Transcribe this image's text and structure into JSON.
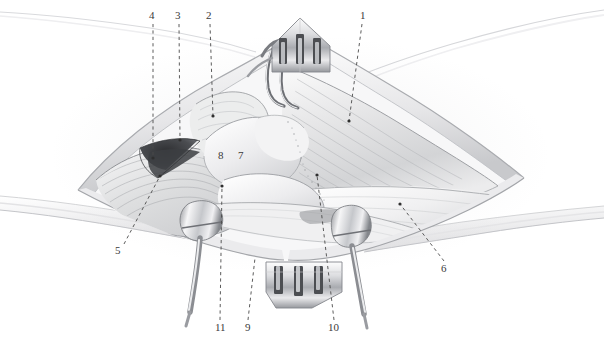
{
  "figure": {
    "medium": "grayscale pencil / airbrush medical illustration",
    "background_color": "#ffffff",
    "ink_color": "#3a3a3a",
    "width": 604,
    "height": 340
  },
  "labels": [
    {
      "id": "label-1",
      "text": "1",
      "x": 360,
      "y": 10,
      "leader": {
        "from": [
          362,
          24
        ],
        "to": [
          349,
          121
        ],
        "dot_at_end": true
      }
    },
    {
      "id": "label-2",
      "text": "2",
      "x": 206,
      "y": 10,
      "leader": {
        "from": [
          210,
          24
        ],
        "to": [
          213,
          116
        ],
        "dot_at_end": true
      }
    },
    {
      "id": "label-3",
      "text": "3",
      "x": 175,
      "y": 10,
      "leader": {
        "from": [
          179,
          24
        ],
        "to": [
          180,
          140
        ],
        "dot_at_end": true
      }
    },
    {
      "id": "label-4",
      "text": "4",
      "x": 149,
      "y": 10,
      "leader": {
        "from": [
          153,
          24
        ],
        "to": [
          153,
          158
        ],
        "dot_at_end": true
      }
    },
    {
      "id": "label-5",
      "text": "5",
      "x": 115,
      "y": 245,
      "leader": {
        "from": [
          124,
          244
        ],
        "to": [
          160,
          176
        ],
        "dot_at_end": true
      }
    },
    {
      "id": "label-6",
      "text": "6",
      "x": 441,
      "y": 263,
      "leader": {
        "from": [
          444,
          261
        ],
        "to": [
          400,
          204
        ],
        "dot_at_end": true
      }
    },
    {
      "id": "label-7",
      "text": "7",
      "x": 238,
      "y": 150,
      "leader": null
    },
    {
      "id": "label-8",
      "text": "8",
      "x": 218,
      "y": 150,
      "leader": null
    },
    {
      "id": "label-9",
      "text": "9",
      "x": 245,
      "y": 322,
      "leader": {
        "from": [
          248,
          320
        ],
        "to": [
          255,
          258
        ],
        "dot_at_end": false
      }
    },
    {
      "id": "label-10",
      "text": "10",
      "x": 328,
      "y": 322,
      "leader": {
        "from": [
          334,
          320
        ],
        "to": [
          317,
          175
        ],
        "dot_at_end": true
      }
    },
    {
      "id": "label-11",
      "text": "11",
      "x": 215,
      "y": 322,
      "leader": {
        "from": [
          220,
          320
        ],
        "to": [
          222,
          186
        ],
        "dot_at_end": true
      }
    }
  ],
  "instruments": [
    {
      "name": "top-self-retaining-retractor",
      "prongs": 3,
      "position": "top-center",
      "orientation": "prongs-downward-blade-up"
    },
    {
      "name": "bottom-self-retaining-retractor",
      "prongs": 3,
      "position": "bottom-center",
      "orientation": "prongs-upward-blade-down"
    },
    {
      "name": "left-blunt-retractor-hook",
      "position": "lower-left-of-field"
    },
    {
      "name": "right-blunt-retractor-hook",
      "position": "lower-right-of-field"
    },
    {
      "name": "curved-hook-retractor",
      "position": "upper-center"
    }
  ],
  "anatomy_regions": [
    {
      "name": "skin-edge-upper-left",
      "description": "faint skin contour line running across the upper left background"
    },
    {
      "name": "skin-edge-upper-right",
      "description": "faint skin contour line running across the upper right background"
    },
    {
      "name": "skin-edge-lower-left",
      "description": "shaded skin band running across the lower left background"
    },
    {
      "name": "skin-edge-lower-right",
      "description": "shaded skin band running across the lower right background"
    },
    {
      "name": "wound-margin",
      "description": "lens / almond shaped retracted incision occupying the centre of the field"
    },
    {
      "name": "muscle-belly-right",
      "description": "large striated muscle belly filling the right half of the exposure"
    },
    {
      "name": "muscle-belly-left",
      "description": "striated muscle flap on the left of the exposure"
    },
    {
      "name": "dark-recess",
      "description": "deep dark triangular recess left of centre"
    },
    {
      "name": "bone-or-capsule",
      "description": "pale rounded structures at the centre, labelled 7 and 8"
    },
    {
      "name": "tendon-sheet",
      "description": "pale fibrous sheet sweeping to the right"
    }
  ]
}
